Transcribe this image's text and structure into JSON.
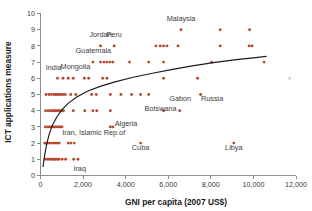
{
  "chart_data": {
    "type": "scatter",
    "title": "",
    "xlabel": "GNI per capita (2007  US$)",
    "ylabel": "ICT applications measure",
    "xlim": [
      0,
      12000
    ],
    "ylim": [
      0,
      10
    ],
    "grid": false,
    "legend": "none",
    "xticks": [
      0,
      2000,
      4000,
      6000,
      8000,
      10000,
      12000
    ],
    "xtick_labels": [
      "0",
      "2,000",
      "4,000",
      "6,000",
      "8,000",
      "10,000",
      "12,000"
    ],
    "yticks": [
      0,
      1,
      2,
      3,
      4,
      5,
      6,
      7,
      8,
      9,
      10
    ],
    "ytick_labels": [
      "0",
      "1",
      "2",
      "3",
      "4",
      "5",
      "6",
      "7",
      "8",
      "9",
      "10"
    ],
    "marker_color": "#b44a2e",
    "trend_color": "#1c1c1c",
    "axis_color": "#8d8d8d",
    "series": [
      {
        "name": "Countries",
        "points": [
          [
            220,
            1
          ],
          [
            330,
            1
          ],
          [
            420,
            1
          ],
          [
            500,
            1
          ],
          [
            560,
            1
          ],
          [
            640,
            1
          ],
          [
            700,
            1
          ],
          [
            780,
            1
          ],
          [
            870,
            1
          ],
          [
            1020,
            1
          ],
          [
            1180,
            1
          ],
          [
            1560,
            1
          ],
          [
            1760,
            1
          ],
          [
            200,
            2
          ],
          [
            250,
            2
          ],
          [
            330,
            2
          ],
          [
            420,
            2
          ],
          [
            520,
            2
          ],
          [
            620,
            2
          ],
          [
            700,
            2
          ],
          [
            790,
            2
          ],
          [
            880,
            2
          ],
          [
            1300,
            2
          ],
          [
            1420,
            2
          ],
          [
            1580,
            2
          ],
          [
            4700,
            2
          ],
          [
            9080,
            2
          ],
          [
            230,
            3
          ],
          [
            340,
            3
          ],
          [
            430,
            3
          ],
          [
            520,
            3
          ],
          [
            600,
            3
          ],
          [
            660,
            3
          ],
          [
            720,
            3
          ],
          [
            800,
            3
          ],
          [
            870,
            3
          ],
          [
            940,
            3
          ],
          [
            1010,
            3
          ],
          [
            3280,
            3
          ],
          [
            3400,
            3
          ],
          [
            240,
            4
          ],
          [
            360,
            4
          ],
          [
            470,
            4
          ],
          [
            560,
            4
          ],
          [
            640,
            4
          ],
          [
            700,
            4
          ],
          [
            770,
            4
          ],
          [
            840,
            4
          ],
          [
            910,
            4
          ],
          [
            1000,
            4
          ],
          [
            1080,
            4
          ],
          [
            1540,
            4
          ],
          [
            2080,
            4
          ],
          [
            2460,
            4
          ],
          [
            2640,
            4
          ],
          [
            3280,
            4
          ],
          [
            5780,
            4
          ],
          [
            6540,
            4
          ],
          [
            260,
            5
          ],
          [
            400,
            5
          ],
          [
            520,
            5
          ],
          [
            640,
            5
          ],
          [
            720,
            5
          ],
          [
            800,
            5
          ],
          [
            880,
            5
          ],
          [
            960,
            5
          ],
          [
            1060,
            5
          ],
          [
            1160,
            5
          ],
          [
            1420,
            5
          ],
          [
            1660,
            5
          ],
          [
            2400,
            5
          ],
          [
            2620,
            5
          ],
          [
            3280,
            5
          ],
          [
            3780,
            5
          ],
          [
            4280,
            5
          ],
          [
            4700,
            5
          ],
          [
            5080,
            5
          ],
          [
            7520,
            5
          ],
          [
            800,
            6
          ],
          [
            1060,
            6
          ],
          [
            1300,
            6
          ],
          [
            1540,
            6
          ],
          [
            2060,
            6
          ],
          [
            2260,
            6
          ],
          [
            2920,
            6
          ],
          [
            3120,
            6
          ],
          [
            5780,
            6
          ],
          [
            7380,
            6
          ],
          [
            11700,
            6
          ],
          [
            2460,
            7
          ],
          [
            2820,
            7
          ],
          [
            2980,
            7
          ],
          [
            3120,
            7
          ],
          [
            3260,
            7
          ],
          [
            3400,
            7
          ],
          [
            4180,
            7
          ],
          [
            5080,
            7
          ],
          [
            5780,
            7
          ],
          [
            8040,
            7
          ],
          [
            10500,
            7
          ],
          [
            2820,
            8
          ],
          [
            3460,
            8
          ],
          [
            5420,
            8
          ],
          [
            5620,
            8
          ],
          [
            5780,
            8
          ],
          [
            5940,
            8
          ],
          [
            6460,
            8
          ],
          [
            8440,
            8
          ],
          [
            9800,
            8
          ],
          [
            9940,
            8
          ],
          [
            6600,
            9
          ],
          [
            8440,
            9
          ],
          [
            9820,
            9
          ]
        ]
      }
    ],
    "trend_curve": {
      "description": "fitted logarithmic trend line",
      "points": [
        [
          120,
          0.55
        ],
        [
          200,
          1.3
        ],
        [
          300,
          2.0
        ],
        [
          420,
          2.6
        ],
        [
          560,
          3.1
        ],
        [
          760,
          3.6
        ],
        [
          1000,
          4.05
        ],
        [
          1300,
          4.45
        ],
        [
          1700,
          4.85
        ],
        [
          2200,
          5.2
        ],
        [
          2800,
          5.5
        ],
        [
          3500,
          5.78
        ],
        [
          4300,
          6.05
        ],
        [
          5200,
          6.3
        ],
        [
          6200,
          6.55
        ],
        [
          7200,
          6.78
        ],
        [
          8200,
          6.98
        ],
        [
          9200,
          7.15
        ],
        [
          10100,
          7.28
        ],
        [
          10600,
          7.35
        ]
      ]
    },
    "annotations": [
      {
        "text": "Malaysia",
        "x": 6600,
        "y": 9.55
      },
      {
        "text": "Jordan",
        "x": 2820,
        "y": 8.55
      },
      {
        "text": "Peru",
        "x": 3460,
        "y": 8.55
      },
      {
        "text": "Guatemala",
        "x": 2480,
        "y": 7.55
      },
      {
        "text": "India",
        "x": 620,
        "y": 6.5
      },
      {
        "text": "Mongolia",
        "x": 1640,
        "y": 6.55
      },
      {
        "text": "Gabon",
        "x": 6560,
        "y": 4.6
      },
      {
        "text": "Russia",
        "x": 8060,
        "y": 4.6
      },
      {
        "text": "Botswana",
        "x": 5640,
        "y": 4.0
      },
      {
        "text": "Algeria",
        "x": 4020,
        "y": 3.05
      },
      {
        "text": "Iran, Islamic Rep.of",
        "x": 2500,
        "y": 2.48
      },
      {
        "text": "Cuba",
        "x": 4700,
        "y": 1.55
      },
      {
        "text": "Libya",
        "x": 9080,
        "y": 1.55
      },
      {
        "text": "Iraq",
        "x": 1840,
        "y": 0.3
      }
    ]
  }
}
